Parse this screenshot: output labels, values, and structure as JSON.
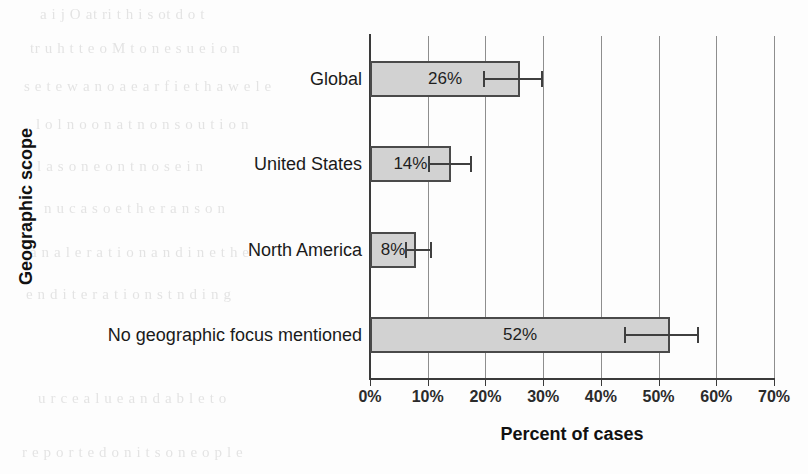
{
  "chart_data": {
    "type": "bar",
    "orientation": "horizontal",
    "title": "",
    "xlabel": "Percent of cases",
    "ylabel": "Geographic scope",
    "categories": [
      "Global",
      "United States",
      "North America",
      "No geographic focus mentioned"
    ],
    "values": [
      26,
      14,
      8,
      52
    ],
    "value_labels": [
      "26%",
      "14%",
      "8%",
      "52%"
    ],
    "error_low": [
      19.5,
      10.0,
      6.0,
      44.0
    ],
    "error_high": [
      30.0,
      17.7,
      10.7,
      57.0
    ],
    "xlim": [
      0,
      70
    ],
    "xticks": [
      0,
      10,
      20,
      30,
      40,
      50,
      60,
      70
    ],
    "xtick_labels": [
      "0%",
      "10%",
      "20%",
      "30%",
      "40%",
      "50%",
      "60%",
      "70%"
    ],
    "grid": true,
    "grid_axis": "x",
    "legend": "none",
    "bar_fill_color": "#d2d2d2",
    "bar_border_color": "#4a4a4a",
    "error_bar_color": "#3f3f3f",
    "axis_color": "#3a3a3a",
    "gridline_color": "#8e8e8e",
    "text_color": "#1a1a1a"
  },
  "background_ghost_text": [
    "a  i    j  O      at          ri  t  h    i  s     ot        d    o  t",
    "tr   u   h   t     t  e   o        M t  o   n  e    s  u   e   i   o n",
    "s e     t   e w a     n o   a  e a r      f  i  e   t h   a   w  e   l e",
    "l   o   l     n  o    o   n    a  t   n  o   n  s    o  u t   i  o  n",
    "t  l  a  s     o  n  e   o   n      t   n  o   s    e    i n",
    "n   u    c   a   s   o   e   t h   e  r     a  n   s     o  n",
    "a  n   a  l  e   r   a   t i o n    a n   d   i  n  e   t  h  e",
    "e    n  d     i  t   e r  a  t i  o n  s      t    n  d  i  n  g",
    "u  r  c  e     a  l u  e   a n  d     a  b  l  e   t  o",
    "r  e   p  o  r  t  e  d     o  n     i  t s     o  n    e  o  p  l  e"
  ]
}
